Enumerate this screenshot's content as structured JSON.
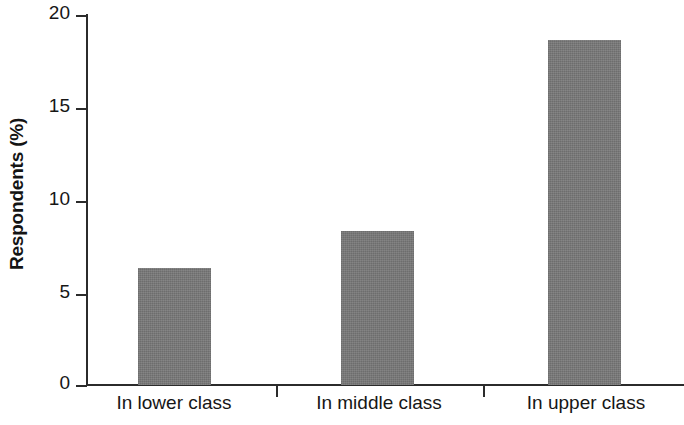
{
  "chart_data": {
    "type": "bar",
    "title": "",
    "xlabel": "",
    "ylabel": "Respondents (%)",
    "categories": [
      "In lower class",
      "In middle class",
      "In upper class"
    ],
    "values": [
      6.3,
      8.3,
      18.6
    ],
    "ylim": [
      0,
      20
    ],
    "yticks": [
      0,
      5,
      10,
      15,
      20
    ],
    "ytick_labels": [
      "0",
      "5",
      "10",
      "15",
      "20"
    ],
    "grid": false,
    "legend": null,
    "series": [
      {
        "name": "Respondents",
        "values": [
          6.3,
          8.3,
          18.6
        ],
        "color": "#787878"
      }
    ],
    "bar_color": "#787878",
    "axis_color": "#2b2b2b",
    "background_color": "#ffffff"
  },
  "axis": {
    "y_title": "Respondents (%)",
    "tick_0": "0",
    "tick_1": "5",
    "tick_2": "10",
    "tick_3": "15",
    "tick_4": "20"
  },
  "categories": {
    "cat_0": "In lower class",
    "cat_1": "In middle class",
    "cat_2": "In upper class"
  }
}
